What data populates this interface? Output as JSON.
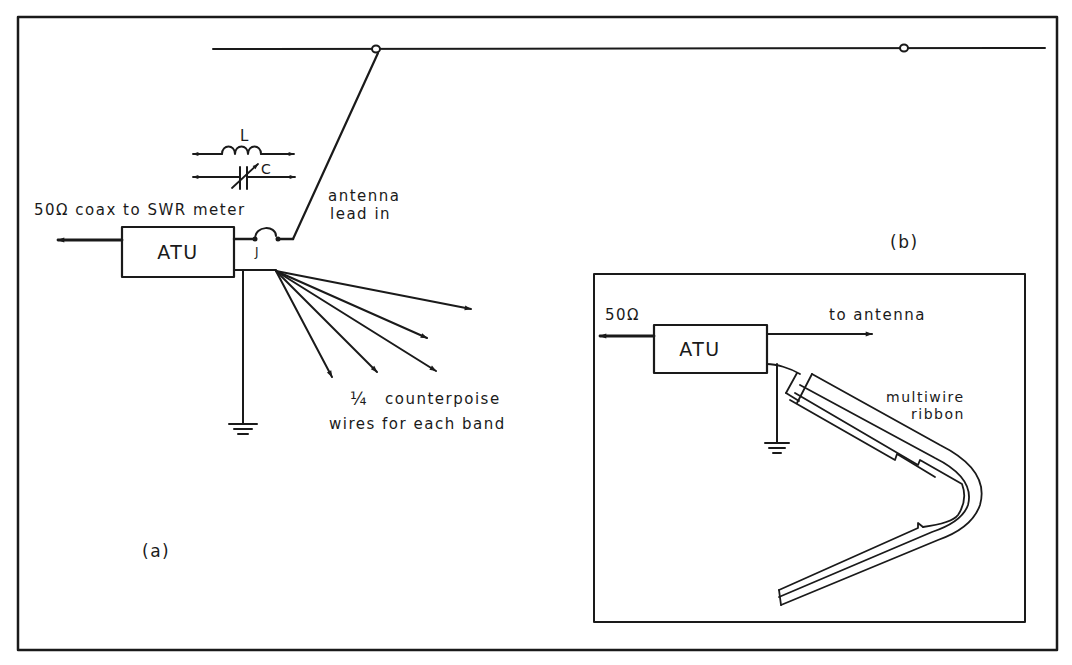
{
  "figure": {
    "panel_a": {
      "label": "(a)",
      "atu_label": "ATU",
      "coax_label": "50Ω coax to SWR meter",
      "inductor_label": "L",
      "capacitor_label": "C",
      "junction_label": "J",
      "lead_in_label_line1": "antenna",
      "lead_in_label_line2": "lead in",
      "counterpoise_fraction": "¼",
      "counterpoise_line1": "counterpoise",
      "counterpoise_line2": "wires for each band",
      "counterpoise_wire_count": 5
    },
    "panel_b": {
      "label": "(b)",
      "atu_label": "ATU",
      "impedance_label": "50Ω",
      "antenna_label": "to antenna",
      "ribbon_label_line1": "multiwire",
      "ribbon_label_line2": "ribbon"
    },
    "colors": {
      "ink": "#1a1a1a",
      "paper": "#ffffff"
    }
  }
}
